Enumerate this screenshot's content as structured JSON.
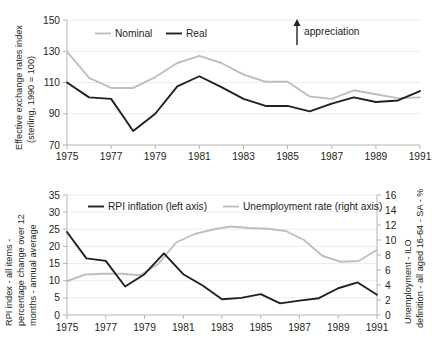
{
  "chart_data": [
    {
      "id": "exchange-rates",
      "type": "line",
      "title": "",
      "xlabel": "",
      "ylabel": "Effective exchange rates index (sterling, 1990 = 100)",
      "ylabel_line1": "Effective exchange rates index",
      "ylabel_line2": "(sterling, 1990 = 100)",
      "x": [
        1975,
        1976,
        1977,
        1978,
        1979,
        1980,
        1981,
        1982,
        1983,
        1984,
        1985,
        1986,
        1987,
        1988,
        1989,
        1990,
        1991
      ],
      "xlim": [
        1975,
        1991
      ],
      "ylim": [
        70,
        150
      ],
      "yticks": [
        70,
        90,
        110,
        130,
        150
      ],
      "xticks": [
        1975,
        1977,
        1979,
        1981,
        1983,
        1985,
        1987,
        1989,
        1991
      ],
      "xticklabels": [
        "1975",
        "1977",
        "1979",
        "1981",
        "1983",
        "1985",
        "1987",
        "1989",
        "1991"
      ],
      "yticklabels": [
        "70",
        "90",
        "110",
        "130",
        "150"
      ],
      "grid": true,
      "legend_position": "top-left",
      "series": [
        {
          "name": "Nominal",
          "color": "#bfbfbf",
          "values": [
            129.8,
            113.0,
            106.5,
            106.5,
            113.5,
            122.5,
            127.0,
            122.5,
            115.0,
            110.5,
            110.5,
            101.0,
            99.5,
            105.0,
            102.5,
            100.0,
            100.5
          ]
        },
        {
          "name": "Real",
          "color": "#231f20",
          "values": [
            110.0,
            100.5,
            99.5,
            79.0,
            90.0,
            107.5,
            114.0,
            107.0,
            99.5,
            95.0,
            95.0,
            91.5,
            96.5,
            100.5,
            97.5,
            98.5,
            104.5
          ]
        }
      ],
      "annotations": [
        {
          "text": "appreciation",
          "type": "up-arrow"
        }
      ]
    },
    {
      "id": "inflation-unemployment",
      "type": "line",
      "title": "",
      "xlabel": "",
      "ylabel": "RPI index - all items - percentage change over 12 months - annual average",
      "ylabel_line1": "RPI index - all items -",
      "ylabel_line2": "percentage change over 12",
      "ylabel_line3": "months - annual average",
      "y2label": "Unemployment - ILO definition - all aged 16-64 - SA - %",
      "y2label_line1": "Unemployment - ILO",
      "y2label_line2": "definition - all aged 16-64 - SA - %",
      "x": [
        1975,
        1976,
        1977,
        1978,
        1979,
        1980,
        1981,
        1982,
        1983,
        1984,
        1985,
        1986,
        1987,
        1988,
        1989,
        1990,
        1991
      ],
      "xlim": [
        1975,
        1991
      ],
      "ylim": [
        0,
        35
      ],
      "y2lim": [
        0,
        16
      ],
      "yticks": [
        0,
        5,
        10,
        15,
        20,
        25,
        30,
        35
      ],
      "yticklabels": [
        "0",
        "5",
        "10",
        "15",
        "20",
        "25",
        "30",
        "35"
      ],
      "y2ticks": [
        0,
        2,
        4,
        6,
        8,
        10,
        12,
        14,
        16
      ],
      "y2ticklabels": [
        "0",
        "2",
        "4",
        "6",
        "8",
        "10",
        "12",
        "14",
        "16"
      ],
      "xticks": [
        1975,
        1977,
        1979,
        1981,
        1983,
        1985,
        1987,
        1989,
        1991
      ],
      "xticklabels": [
        "1975",
        "1977",
        "1979",
        "1981",
        "1983",
        "1985",
        "1987",
        "1989",
        "1991"
      ],
      "grid": true,
      "legend_position": "top-center",
      "series": [
        {
          "name": "RPI inflation (left axis)",
          "axis": "left",
          "color": "#231f20",
          "values": [
            24.2,
            16.5,
            15.8,
            8.3,
            11.9,
            18.0,
            11.9,
            8.6,
            4.6,
            5.0,
            6.1,
            3.4,
            4.2,
            4.9,
            7.8,
            9.5,
            5.9
          ]
        },
        {
          "name": "Unemployment rate (right axis)",
          "axis": "right",
          "color": "#bfbfbf",
          "values": [
            4.5,
            5.4,
            5.5,
            5.5,
            5.3,
            6.8,
            9.7,
            10.8,
            11.4,
            11.8,
            11.6,
            11.5,
            11.2,
            10.0,
            7.9,
            7.1,
            7.2,
            8.7
          ]
        }
      ]
    }
  ]
}
